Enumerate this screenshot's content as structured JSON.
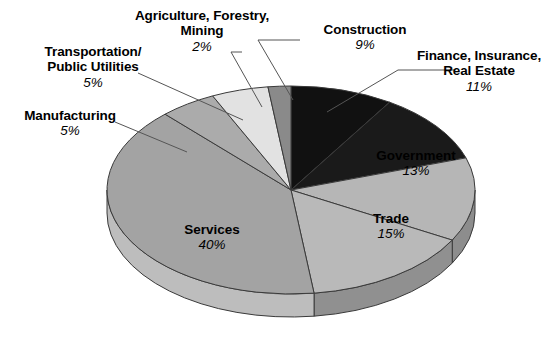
{
  "chart_data": {
    "type": "pie",
    "title": "",
    "subtitle": "",
    "legend_position": "callouts",
    "grid": false,
    "units": "percent",
    "categories": [
      "Construction",
      "Finance, Insurance, Real Estate",
      "Government",
      "Trade",
      "Services",
      "Manufacturing",
      "Transportation/Public Utilities",
      "Agriculture, Forestry, Mining"
    ],
    "values": [
      9,
      11,
      13,
      15,
      40,
      5,
      5,
      2
    ],
    "slices": [
      {
        "name": "Construction",
        "label_line1": "Construction",
        "label_line2": "",
        "percent_text": "9%",
        "value": 9,
        "color": "#111111",
        "side_color": "#000000",
        "label_placement": "callout"
      },
      {
        "name": "Finance, Insurance, Real Estate",
        "label_line1": "Finance, Insurance,",
        "label_line2": "Real Estate",
        "percent_text": "11%",
        "value": 11,
        "color": "#1a1a1a",
        "side_color": "#050505",
        "label_placement": "callout"
      },
      {
        "name": "Government",
        "label_line1": "Government",
        "label_line2": "",
        "percent_text": "13%",
        "value": 13,
        "color": "#b6b6b6",
        "side_color": "#8d8d8d",
        "label_placement": "inside"
      },
      {
        "name": "Trade",
        "label_line1": "Trade",
        "label_line2": "",
        "percent_text": "15%",
        "value": 15,
        "color": "#b9b9b9",
        "side_color": "#909090",
        "label_placement": "inside"
      },
      {
        "name": "Services",
        "label_line1": "Services",
        "label_line2": "",
        "percent_text": "40%",
        "value": 40,
        "color": "#a3a3a3",
        "side_color": "#bdbdbd",
        "label_placement": "inside"
      },
      {
        "name": "Manufacturing",
        "label_line1": "Manufacturing",
        "label_line2": "",
        "percent_text": "5%",
        "value": 5,
        "color": "#ababab",
        "side_color": "#8f8f8f",
        "label_placement": "callout"
      },
      {
        "name": "Transportation/Public Utilities",
        "label_line1": "Transportation/",
        "label_line2": "Public Utilities",
        "percent_text": "5%",
        "value": 5,
        "color": "#e2e2e2",
        "side_color": "#c4c4c4",
        "label_placement": "callout"
      },
      {
        "name": "Agriculture, Forestry, Mining",
        "label_line1": "Agriculture, Forestry,",
        "label_line2": "Mining",
        "percent_text": "2%",
        "value": 2,
        "color": "#8a8a8a",
        "side_color": "#6e6e6e",
        "label_placement": "callout"
      }
    ],
    "geometry": {
      "center_x": 291,
      "center_y": 190,
      "radius_x": 184,
      "radius_y": 104,
      "depth": 23,
      "start_angle_deg": -90
    },
    "stroke_color": "#3a3a3a",
    "background": "#ffffff"
  }
}
